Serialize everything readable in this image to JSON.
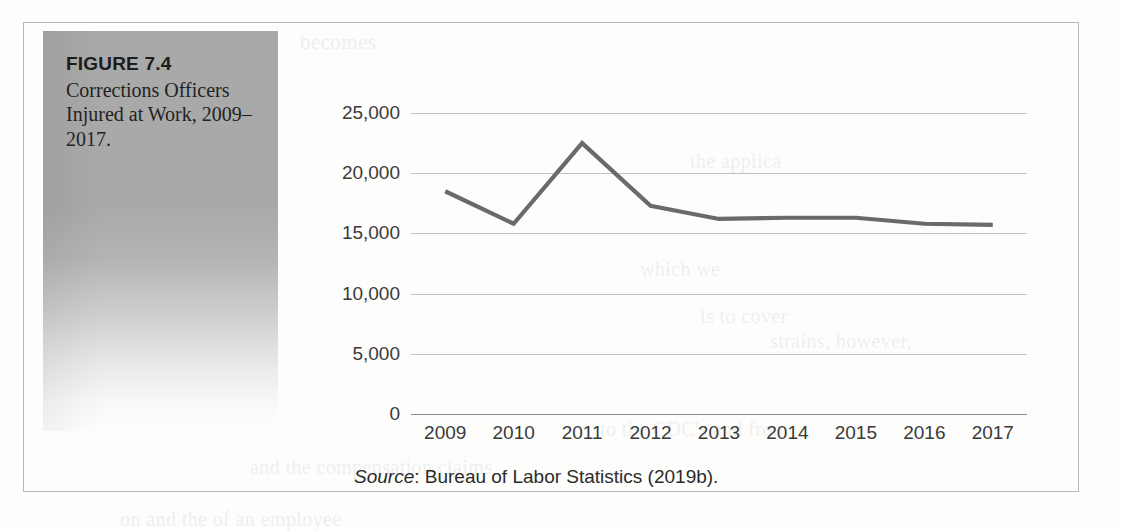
{
  "figure": {
    "number_label": "FIGURE 7.4",
    "caption": "Corrections Officers Injured at Work, 2009–2017.",
    "source_label": "Source",
    "source_text": ": Bureau of Labor Statistics (2019b)."
  },
  "colors": {
    "line": "#6a6a6a",
    "gridline": "#c2c2c2",
    "axis": "#8f8f8f",
    "caption_panel": "#a9a9a9",
    "text": "#3a3a3a",
    "border": "#b9b9b9"
  },
  "bleed_text": [
    {
      "text": "becomes",
      "x": 300,
      "y": 30,
      "size": 21
    },
    {
      "text": "the applica",
      "x": 690,
      "y": 150,
      "size": 20
    },
    {
      "text": "which we",
      "x": 640,
      "y": 258,
      "size": 20
    },
    {
      "text": "is to cover",
      "x": 700,
      "y": 305,
      "size": 20
    },
    {
      "text": "strains, however,",
      "x": 770,
      "y": 330,
      "size": 20
    },
    {
      "text": "injuries",
      "x": 170,
      "y": 356,
      "size": 20
    },
    {
      "text": "to the CDC's and from",
      "x": 600,
      "y": 418,
      "size": 20
    },
    {
      "text": "and the compensation claims",
      "x": 250,
      "y": 456,
      "size": 20
    },
    {
      "text": "on and the of an employee",
      "x": 120,
      "y": 508,
      "size": 20
    }
  ],
  "chart_data": {
    "type": "line",
    "title": "",
    "xlabel": "",
    "ylabel": "",
    "grid": true,
    "legend": "none",
    "categories": [
      "2009",
      "2010",
      "2011",
      "2012",
      "2013",
      "2014",
      "2015",
      "2016",
      "2017"
    ],
    "values": [
      18500,
      15800,
      22500,
      17300,
      16200,
      16300,
      16300,
      15800,
      15700
    ],
    "series": [
      {
        "name": "Corrections officers injured at work",
        "values": [
          18500,
          15800,
          22500,
          17300,
          16200,
          16300,
          16300,
          15800,
          15700
        ]
      }
    ],
    "ylim": [
      0,
      25000
    ],
    "yticks": [
      0,
      5000,
      10000,
      15000,
      20000,
      25000
    ],
    "ytick_labels": [
      "0",
      "5,000",
      "10,000",
      "15,000",
      "20,000",
      "25,000"
    ]
  }
}
